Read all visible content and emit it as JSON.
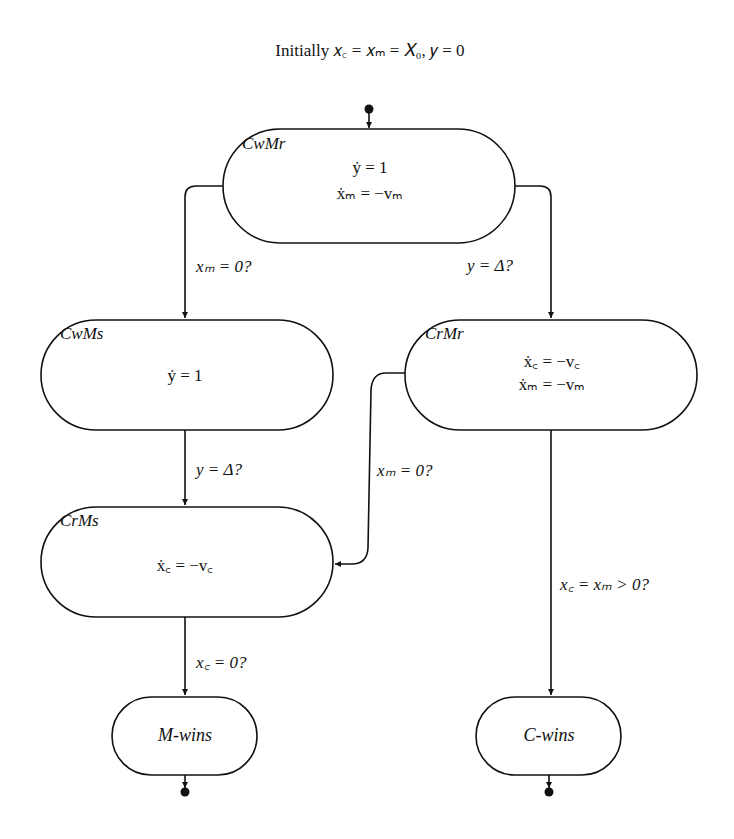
{
  "title_display": "Initially 𝑥꜀ = 𝑥ₘ = 𝑋₀,  𝑦 = 0",
  "colors": {
    "stroke": "#111111",
    "background": "#ffffff"
  },
  "states": [
    {
      "id": "CwMr",
      "name": "CwMr",
      "equations": [
        "ẏ = 1",
        "ẋₘ = −vₘ"
      ]
    },
    {
      "id": "CwMs",
      "name": "CwMs",
      "equations": [
        "ẏ = 1"
      ]
    },
    {
      "id": "CrMr",
      "name": "CrMr",
      "equations": [
        "ẋ꜀ = −v꜀",
        "ẋₘ = −vₘ"
      ]
    },
    {
      "id": "CrMs",
      "name": "CrMs",
      "equations": [
        "ẋ꜀ = −v꜀"
      ]
    },
    {
      "id": "M-wins",
      "name": "M-wins",
      "equations": []
    },
    {
      "id": "C-wins",
      "name": "C-wins",
      "equations": []
    }
  ],
  "transitions": [
    {
      "from": "start",
      "to": "CwMr",
      "guard": ""
    },
    {
      "from": "CwMr",
      "to": "CwMs",
      "guard": "xₘ = 0?"
    },
    {
      "from": "CwMr",
      "to": "CrMr",
      "guard": "y = Δ?"
    },
    {
      "from": "CwMs",
      "to": "CrMs",
      "guard": "y = Δ?"
    },
    {
      "from": "CrMr",
      "to": "CrMs",
      "guard": "xₘ = 0?"
    },
    {
      "from": "CrMs",
      "to": "M-wins",
      "guard": "x꜀ = 0?"
    },
    {
      "from": "CrMr",
      "to": "C-wins",
      "guard": "x꜀ = xₘ > 0?"
    },
    {
      "from": "M-wins",
      "to": "end",
      "guard": ""
    },
    {
      "from": "C-wins",
      "to": "end",
      "guard": ""
    }
  ]
}
